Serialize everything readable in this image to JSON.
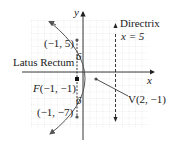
{
  "figure": {
    "axes": {
      "x_label": "x",
      "y_label": "y"
    },
    "grid": {
      "unit_px": 6.5,
      "origin_px": [
        83,
        72
      ],
      "x_range": [
        -8,
        10
      ],
      "y_range": [
        -8,
        8
      ]
    },
    "parabola": {
      "equation": "(y+1)^2 = -12(x-2)",
      "opens": "left",
      "p": -3
    },
    "labels": {
      "directrix_title": "Directrix",
      "directrix_eq": "x = 5",
      "latus_rectum": "Latus Rectum",
      "upper_endpoint": "(−1, 5)",
      "lower_endpoint": "(−1, −7)",
      "focus": "F(−1, −1)",
      "vertex": "V(2, −1)",
      "half_length_top": "6",
      "half_length_bottom": "6"
    },
    "points": {
      "focus": [
        -1,
        -1
      ],
      "vertex": [
        2,
        -1
      ],
      "upper_endpoint": [
        -1,
        5
      ],
      "lower_endpoint": [
        -1,
        -7
      ]
    },
    "directrix_x": 5,
    "colors": {
      "curve": "#555555",
      "grid": "#cfcfcf",
      "axis": "#222222",
      "text": "#222222"
    }
  }
}
